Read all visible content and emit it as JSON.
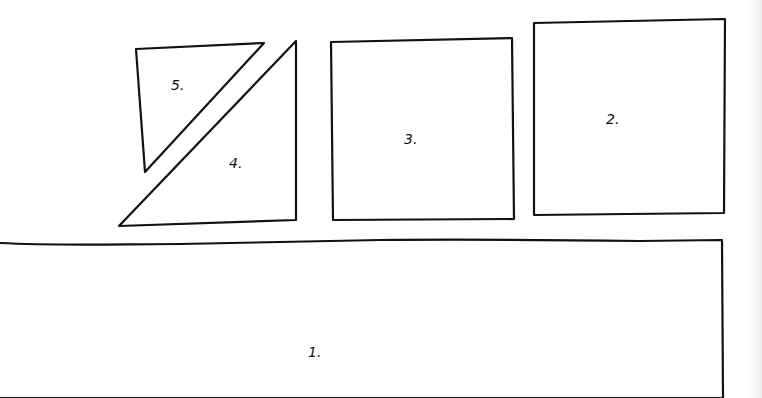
{
  "diagram": {
    "colors": {
      "background": "#ffffff",
      "ink": "#111111"
    },
    "pieces": [
      {
        "id": "1",
        "label": "1.",
        "shape": "rectangle (open bottom, extends off-canvas)"
      },
      {
        "id": "2",
        "label": "2.",
        "shape": "square"
      },
      {
        "id": "3",
        "label": "3.",
        "shape": "square"
      },
      {
        "id": "4",
        "label": "4.",
        "shape": "right triangle"
      },
      {
        "id": "5",
        "label": "5.",
        "shape": "right triangle"
      }
    ]
  }
}
